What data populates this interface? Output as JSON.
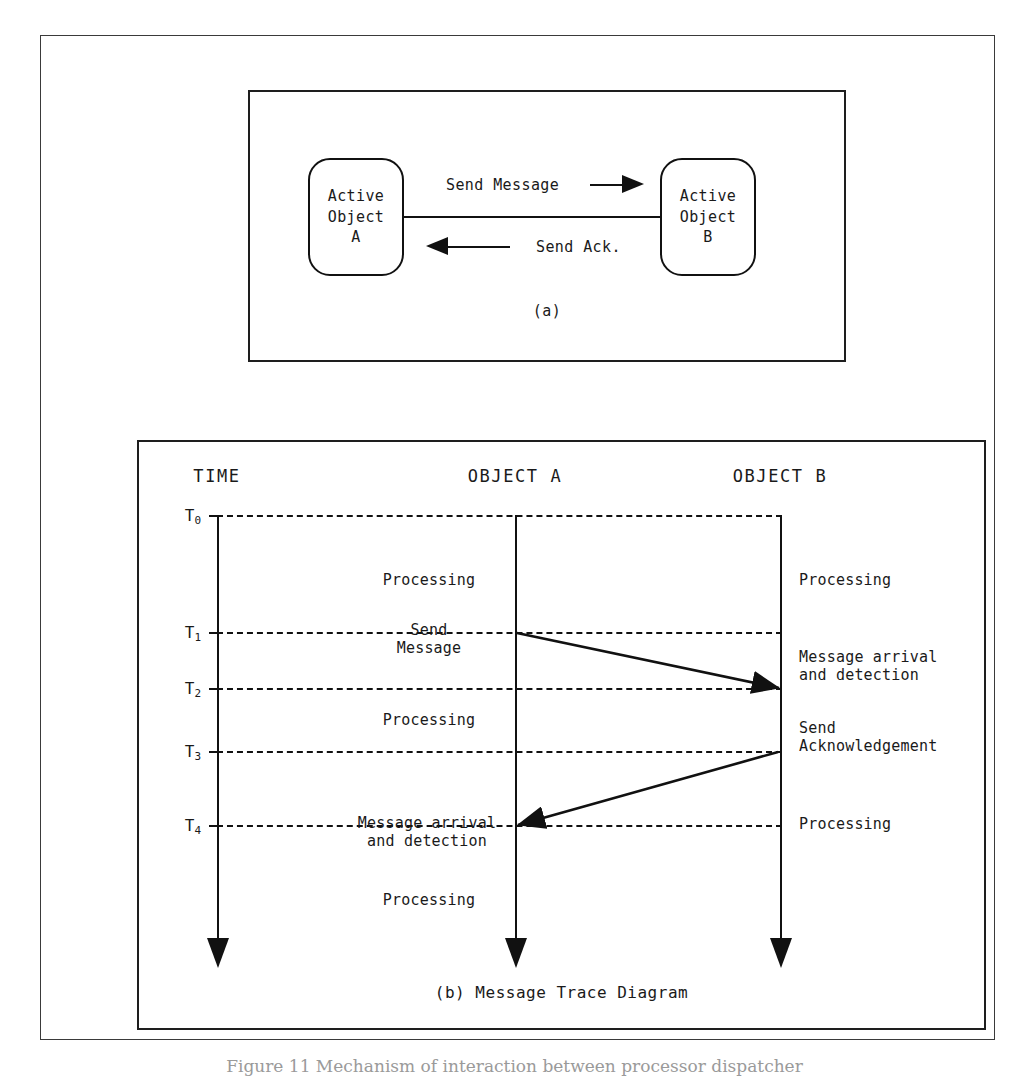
{
  "figure": {
    "caption": "Figure 11  Mechanism of interaction between processor dispatcher"
  },
  "panel_a": {
    "caption": "(a)",
    "object_a": {
      "lines": [
        "Active",
        "Object",
        "A"
      ]
    },
    "object_b": {
      "lines": [
        "Active",
        "Object",
        "B"
      ]
    },
    "send_message_label": "Send Message",
    "send_ack_label": "Send Ack.",
    "arrow_right_icon": "arrow-right-icon",
    "arrow_left_icon": "arrow-left-icon"
  },
  "panel_b": {
    "caption": "(b) Message Trace Diagram",
    "headers": {
      "time": "TIME",
      "object_a": "OBJECT A",
      "object_b": "OBJECT B"
    },
    "time_labels": [
      "T0",
      "T1",
      "T2",
      "T3",
      "T4"
    ],
    "time_marks": [
      "T",
      "T",
      "T",
      "T",
      "T"
    ],
    "time_subs": [
      "0",
      "1",
      "2",
      "3",
      "4"
    ],
    "notes_object_a": [
      "Processing",
      "Send\nMessage",
      "Processing",
      "Message arrival\nand detection",
      "Processing"
    ],
    "notes_object_b": [
      "Processing",
      "Message arrival\nand detection",
      "Send\nAcknowledgement",
      "Processing"
    ],
    "messages": [
      {
        "name": "send-message",
        "from": "OBJECT A",
        "to": "OBJECT B",
        "from_time": "T1",
        "to_time": "T2"
      },
      {
        "name": "send-acknowledgement",
        "from": "OBJECT B",
        "to": "OBJECT A",
        "from_time": "T3",
        "to_time": "T4"
      }
    ]
  },
  "colors": {
    "ink": "#111111",
    "frame": "#3a3a3a",
    "paper": "#ffffff"
  }
}
